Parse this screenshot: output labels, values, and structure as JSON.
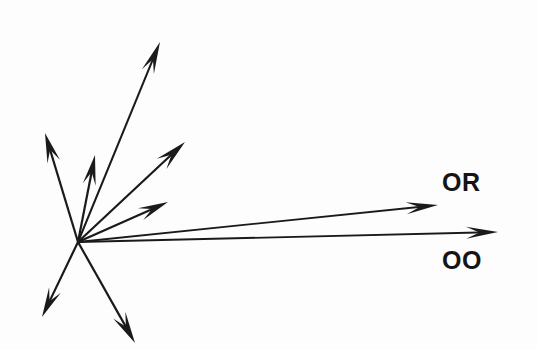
{
  "figure": {
    "width": 537,
    "height": 350,
    "background_color": "#fdfdfd",
    "ink_color": "#1a1a1a"
  },
  "labels": {
    "or": "OR",
    "oo": "OO"
  },
  "chart_data": {
    "type": "scatter",
    "title": "",
    "xlabel": "",
    "ylabel": "",
    "grid": false,
    "legend": "none",
    "origin": {
      "x": 78,
      "y": 242
    },
    "xlim": [
      0,
      537
    ],
    "ylim": [
      350,
      0
    ],
    "series": [
      {
        "name": "vector-1-up-left",
        "label": "",
        "tip": {
          "x": 45,
          "y": 133
        },
        "length": 113,
        "angle_deg": 110.8,
        "shaft_width": 2.2,
        "head_length": 30,
        "head_width": 13
      },
      {
        "name": "vector-2-up",
        "label": "",
        "tip": {
          "x": 95,
          "y": 155
        },
        "length": 89,
        "angle_deg": 79.0,
        "shaft_width": 2.2,
        "head_length": 30,
        "head_width": 13
      },
      {
        "name": "vector-3-up-right-long",
        "label": "",
        "tip": {
          "x": 160,
          "y": 42
        },
        "length": 218,
        "angle_deg": 67.9,
        "shaft_width": 2.0,
        "head_length": 32,
        "head_width": 13
      },
      {
        "name": "vector-4-up-right-medium",
        "label": "",
        "tip": {
          "x": 185,
          "y": 142
        },
        "length": 147,
        "angle_deg": 42.7,
        "shaft_width": 2.2,
        "head_length": 32,
        "head_width": 14
      },
      {
        "name": "vector-5-right-up",
        "label": "",
        "tip": {
          "x": 168,
          "y": 202
        },
        "length": 98,
        "angle_deg": 24.0,
        "shaft_width": 2.2,
        "head_length": 30,
        "head_width": 13
      },
      {
        "name": "vector-6-or",
        "label": "OR",
        "tip": {
          "x": 438,
          "y": 205
        },
        "length": 362,
        "angle_deg": 5.9,
        "shaft_width": 1.8,
        "head_length": 32,
        "head_width": 12
      },
      {
        "name": "vector-7-oo",
        "label": "OO",
        "tip": {
          "x": 498,
          "y": 232
        },
        "length": 420,
        "angle_deg": 1.4,
        "shaft_width": 1.8,
        "head_length": 32,
        "head_width": 12
      },
      {
        "name": "vector-8-down-left",
        "label": "",
        "tip": {
          "x": 42,
          "y": 317
        },
        "length": 83,
        "angle_deg": -115.7,
        "shaft_width": 2.2,
        "head_length": 30,
        "head_width": 13
      },
      {
        "name": "vector-9-down-right",
        "label": "",
        "tip": {
          "x": 135,
          "y": 343
        },
        "length": 116,
        "angle_deg": -60.6,
        "shaft_width": 2.2,
        "head_length": 32,
        "head_width": 14
      }
    ]
  }
}
